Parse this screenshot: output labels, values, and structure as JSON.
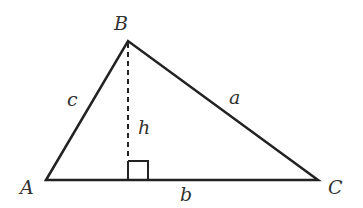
{
  "diagram": {
    "type": "triangle with altitude",
    "vertices": {
      "A": {
        "label": "A",
        "x": 46,
        "y": 180
      },
      "B": {
        "label": "B",
        "x": 128,
        "y": 41
      },
      "C": {
        "label": "C",
        "x": 318,
        "y": 180
      }
    },
    "sides": {
      "a": {
        "label": "a",
        "from": "B",
        "to": "C"
      },
      "b": {
        "label": "b",
        "from": "A",
        "to": "C"
      },
      "c": {
        "label": "c",
        "from": "A",
        "to": "B"
      }
    },
    "altitude": {
      "label": "h",
      "from": "B",
      "style": "dashed"
    },
    "right_angle_marker": true,
    "stroke_color": "#222222"
  }
}
